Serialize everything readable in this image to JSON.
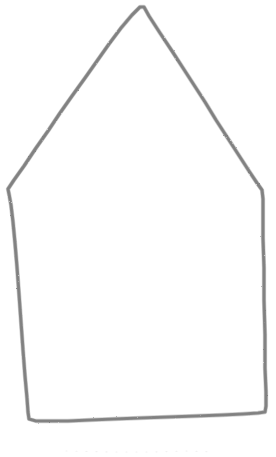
{
  "image": {
    "title": "Hand-drawn house outline",
    "subject": "house-pentagon-sketch",
    "medium": "pencil sketch",
    "width_px": 276,
    "height_px": 457,
    "background_color": "#ffffff",
    "stroke_color": "#8a8a8a",
    "stroke_color_light": "#a8a8a8",
    "stroke_color_dark": "#787878",
    "stroke_width_px": 3.2,
    "faint_marks_color": "#f2f2f2"
  },
  "shape": {
    "name": "house outline",
    "kind": "closed pentagon",
    "vertices": [
      {
        "name": "apex",
        "x": 144,
        "y": 7
      },
      {
        "name": "right-eave",
        "x": 263,
        "y": 190
      },
      {
        "name": "bottom-right",
        "x": 266,
        "y": 412
      },
      {
        "name": "bottom-left",
        "x": 28,
        "y": 420
      },
      {
        "name": "left-eave",
        "x": 8,
        "y": 189
      }
    ],
    "path_d": "M 144 7 L 149 16 L 160 33 L 172 51 L 183 68 L 194 85 L 205 102 L 216 120 L 227 137 L 238 154 L 249 171 L 257 183 L 262 190 L 263 199 L 263 214 L 263 238 L 264 268 L 264 300 L 265 335 L 265 368 L 266 392 L 266 406 L 265 412 L 258 413 L 243 414 L 222 415 L 196 416 L 168 417 L 140 418 L 114 419 L 90 420 L 68 421 L 49 421 L 36 421 L 29 419 L 28 412 L 27 398 L 25 376 L 23 350 L 21 322 L 19 294 L 17 267 L 15 243 L 13 222 L 11 205 L 9 194 L 8 189 L 14 180 L 24 166 L 36 148 L 48 131 L 60 113 L 72 96 L 85 78 L 97 61 L 109 44 L 121 28 L 132 15 L 140 7 Z",
    "faint_ground_path_d": "M 66 451 L 110 452 L 150 452 L 186 451 L 214 452"
  },
  "caption": {
    "text": ""
  }
}
